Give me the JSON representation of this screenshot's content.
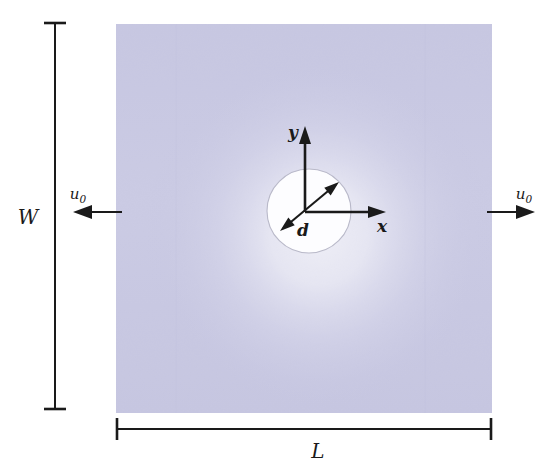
{
  "figure": {
    "type": "engineering-schematic",
    "background_color": "#ffffff"
  },
  "plate": {
    "name": "plate-body",
    "fill_color": "#c9c9e2",
    "highlight_color": "#fdfdff",
    "x": 116,
    "y": 24,
    "width": 376,
    "height": 389
  },
  "hole": {
    "name": "center-hole",
    "fill_color": "#fdfdff",
    "outline_color": "#b9b9c9",
    "center_x": 309,
    "center_y": 211,
    "radius": 42
  },
  "axes": {
    "origin_x": 305,
    "origin_y": 212,
    "y_label": "y",
    "x_label": "x",
    "y_tip_y": 128,
    "x_tip_x": 385
  },
  "diameter": {
    "label": "d",
    "start_x": 280,
    "start_y": 231,
    "end_x": 339,
    "end_y": 182
  },
  "dimensions": {
    "width_label": "W",
    "length_label": "L",
    "width_line_x": 55,
    "width_top_y": 22,
    "width_bottom_y": 410,
    "length_line_y": 429,
    "length_left_x": 116,
    "length_right_x": 492
  },
  "loads": {
    "left": {
      "label_base": "u",
      "label_sub": "0",
      "direction": "left",
      "tail_x": 122,
      "tip_x": 74,
      "y": 212
    },
    "right": {
      "label_base": "u",
      "label_sub": "0",
      "direction": "right",
      "tail_x": 487,
      "tip_x": 534,
      "y": 212
    }
  }
}
